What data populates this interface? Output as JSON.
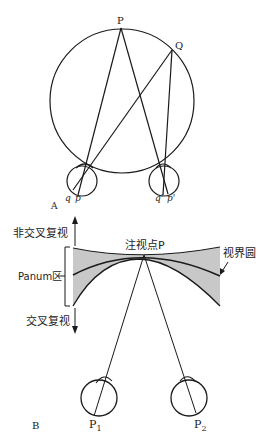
{
  "panel_a": {
    "label": "A",
    "points": {
      "P": "P",
      "Q": "Q",
      "q_left": "q",
      "p_left": "p",
      "q_right": "q'",
      "p_right": "p'"
    }
  },
  "panel_b": {
    "label": "B",
    "fixation_point": "注视点P",
    "horopter": "视界圆",
    "panum_area": "Panum区",
    "uncrossed_diplopia": "非交叉复视",
    "crossed_diplopia": "交叉复视",
    "retina_left": "P",
    "retina_left_sub": "1",
    "retina_right": "P",
    "retina_right_sub": "2"
  },
  "colors": {
    "line": "#1a1a1a",
    "panum_fill": "#c8c8c8",
    "background": "#ffffff"
  }
}
